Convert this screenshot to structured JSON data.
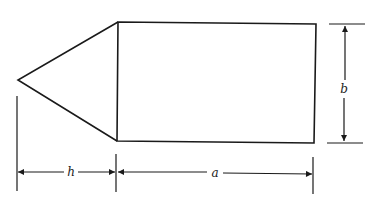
{
  "diagram": {
    "type": "dimensioned geometric figure",
    "colors": {
      "stroke": "#1a1a1a",
      "background": "#ffffff",
      "label": "#222222"
    },
    "shapes": {
      "triangle": {
        "apex": [
          18,
          80
        ],
        "base_top": [
          118,
          22
        ],
        "base_bottom": [
          117,
          141
        ]
      },
      "rectangle": {
        "top_left": [
          118,
          22
        ],
        "top_right": [
          316,
          24
        ],
        "bottom_right": [
          314,
          143
        ],
        "bottom_left": [
          117,
          141
        ]
      }
    },
    "dimensions": [
      {
        "id": "h",
        "label": "h",
        "orientation": "horizontal",
        "description": "height of triangle (apex to rectangle)"
      },
      {
        "id": "a",
        "label": "a",
        "orientation": "horizontal",
        "description": "length of rectangle"
      },
      {
        "id": "b",
        "label": "b",
        "orientation": "vertical",
        "description": "width of rectangle"
      }
    ]
  }
}
